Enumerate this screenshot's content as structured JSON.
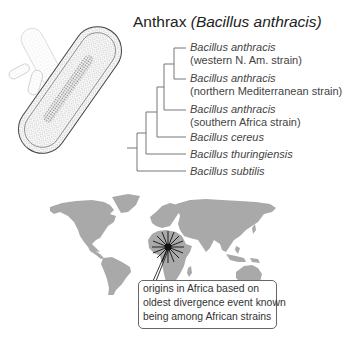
{
  "figure": {
    "title": {
      "common_name": "Anthrax",
      "scientific_name": "(Bacillus anthracis)"
    },
    "illustration": {
      "subject": "rod-shaped bacterium (bacillus) cells",
      "icon": "bacterium-illustration"
    },
    "phylogenetic_tree": {
      "leaves": [
        {
          "species": "Bacillus anthracis",
          "strain": "(western N. Am. strain)"
        },
        {
          "species": "Bacillus anthracis",
          "strain": "(northern Mediterranean strain)"
        },
        {
          "species": "Bacillus anthracis",
          "strain": "(southern Africa strain)"
        },
        {
          "species": "Bacillus cereus",
          "strain": ""
        },
        {
          "species": "Bacillus thuringiensis",
          "strain": ""
        },
        {
          "species": "Bacillus subtilis",
          "strain": ""
        }
      ],
      "line_color": "#777777"
    },
    "map": {
      "type": "world map",
      "land_color": "#a9a9a9",
      "marker": {
        "icon": "starburst-icon",
        "location": "central Africa",
        "color": "#111111"
      },
      "callout": {
        "lines": [
          "origins in Africa based on",
          "oldest divergence event known",
          "being among African strains"
        ]
      }
    }
  }
}
